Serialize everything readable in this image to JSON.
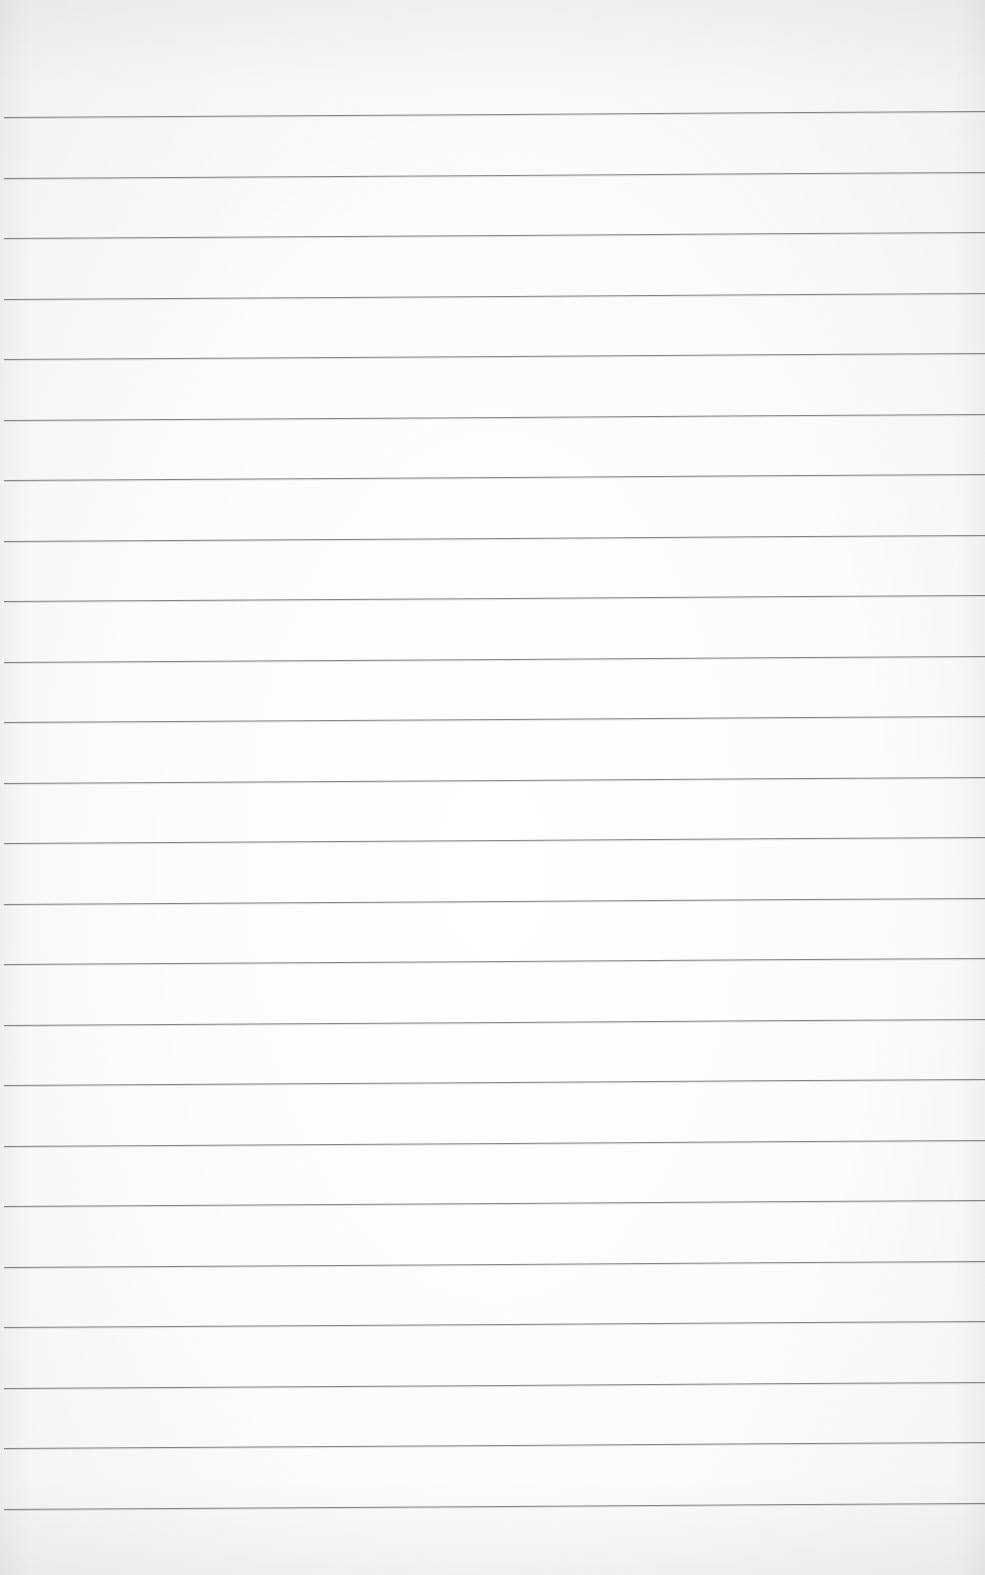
{
  "page": {
    "type": "lined-paper",
    "background_color": "#fbfbfb",
    "rule_color": "#6e6e6e",
    "written_text": ""
  },
  "rules": {
    "count": 24,
    "first_y": 117,
    "spacing": 60.5,
    "tilt_deg": -0.35
  }
}
